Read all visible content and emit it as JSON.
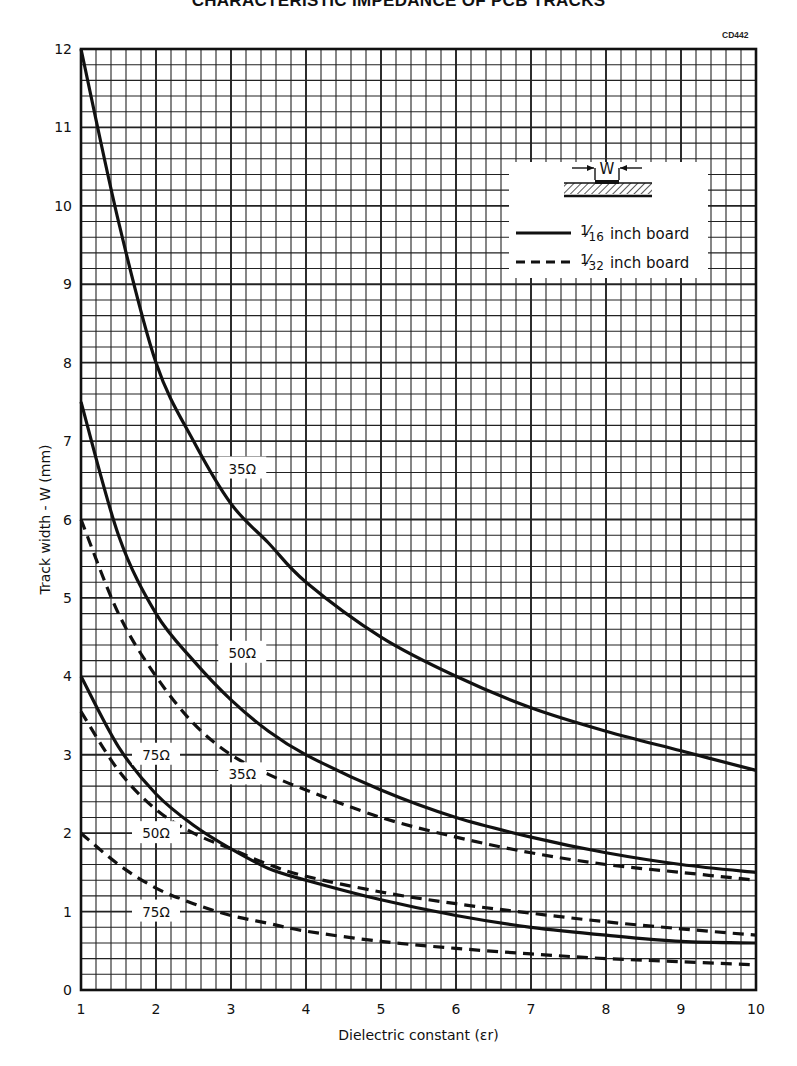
{
  "page": {
    "title": "CHARACTERISTIC IMPEDANCE OF PCB TRACKS",
    "figure_code": "CD442"
  },
  "chart_data": {
    "type": "line",
    "title": "CHARACTERISTIC IMPEDANCE OF PCB TRACKS",
    "xlabel": "Dielectric constant (εr)",
    "ylabel": "Track width - W (mm)",
    "xlim": [
      1,
      10
    ],
    "ylim": [
      0,
      12
    ],
    "x_ticks": [
      1,
      2,
      3,
      4,
      5,
      6,
      7,
      8,
      9,
      10
    ],
    "y_ticks": [
      0,
      1,
      2,
      3,
      4,
      5,
      6,
      7,
      8,
      9,
      10,
      11,
      12
    ],
    "x_minor_step": 0.2,
    "y_minor_step": 0.2,
    "grid": true,
    "legend_position": "upper right",
    "legend": {
      "diagram_label": "W",
      "entries": [
        {
          "style": "solid",
          "fraction_num": "1",
          "fraction_den": "16",
          "label": "inch board"
        },
        {
          "style": "dashed",
          "fraction_num": "1",
          "fraction_den": "32",
          "label": "inch board"
        }
      ]
    },
    "x": [
      1,
      1.5,
      2,
      2.5,
      3,
      3.5,
      4,
      5,
      6,
      7,
      8,
      9,
      10
    ],
    "series": [
      {
        "name": "35Ω (1/16 inch board)",
        "impedance": "35Ω",
        "board": "1/16 inch",
        "style": "solid",
        "values": [
          12.0,
          9.8,
          8.0,
          7.0,
          6.2,
          5.7,
          5.2,
          4.5,
          4.0,
          3.6,
          3.3,
          3.05,
          2.8
        ],
        "label": "35Ω",
        "label_at": [
          3.15,
          6.65
        ]
      },
      {
        "name": "50Ω (1/16 inch board)",
        "impedance": "50Ω",
        "board": "1/16 inch",
        "style": "solid",
        "values": [
          7.5,
          5.8,
          4.8,
          4.2,
          3.7,
          3.3,
          3.0,
          2.55,
          2.2,
          1.95,
          1.75,
          1.6,
          1.5
        ],
        "label": "50Ω",
        "label_at": [
          3.15,
          4.3
        ]
      },
      {
        "name": "75Ω (1/16 inch board)",
        "impedance": "75Ω",
        "board": "1/16 inch",
        "style": "solid",
        "values": [
          4.0,
          3.1,
          2.5,
          2.1,
          1.8,
          1.55,
          1.4,
          1.15,
          0.95,
          0.8,
          0.7,
          0.62,
          0.6
        ],
        "label": "75Ω",
        "label_at": [
          2.0,
          3.0
        ]
      },
      {
        "name": "35Ω (1/32 inch board)",
        "impedance": "35Ω",
        "board": "1/32 inch",
        "style": "dashed",
        "values": [
          6.0,
          4.8,
          4.0,
          3.4,
          3.0,
          2.75,
          2.55,
          2.2,
          1.95,
          1.75,
          1.6,
          1.5,
          1.4
        ],
        "label": "35Ω",
        "label_at": [
          3.15,
          2.75
        ]
      },
      {
        "name": "50Ω (1/32 inch board)",
        "impedance": "50Ω",
        "board": "1/32 inch",
        "style": "dashed",
        "values": [
          3.55,
          2.8,
          2.3,
          2.0,
          1.8,
          1.6,
          1.45,
          1.25,
          1.1,
          0.98,
          0.87,
          0.78,
          0.7
        ],
        "label": "50Ω",
        "label_at": [
          2.0,
          2.0
        ]
      },
      {
        "name": "75Ω (1/32 inch board)",
        "impedance": "75Ω",
        "board": "1/32 inch",
        "style": "dashed",
        "values": [
          2.0,
          1.6,
          1.3,
          1.1,
          0.95,
          0.85,
          0.75,
          0.62,
          0.53,
          0.46,
          0.4,
          0.36,
          0.32
        ],
        "label": "75Ω",
        "label_at": [
          2.0,
          1.0
        ]
      }
    ]
  }
}
